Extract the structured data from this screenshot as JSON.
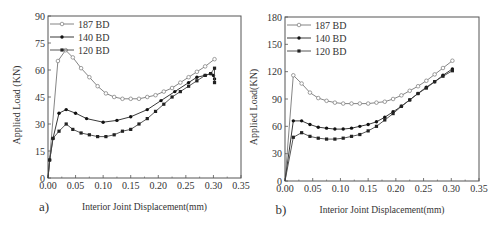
{
  "chart_data": [
    {
      "panel_label": "a)",
      "type": "line",
      "title": "",
      "xlabel": "Interior Joint Displacement(mm)",
      "ylabel": "Applied Load (KN)",
      "xlim": [
        0,
        0.35
      ],
      "ylim": [
        0,
        90
      ],
      "xticks": [
        "0.00",
        "0.05",
        "0.10",
        "0.15",
        "0.20",
        "0.25",
        "0.30",
        "0.35"
      ],
      "yticks": [
        "0",
        "15",
        "30",
        "45",
        "60",
        "75",
        "90"
      ],
      "grid": false,
      "legend_position": "upper left",
      "frame": {
        "left": 48,
        "right": 241,
        "top": 16,
        "bottom": 178
      },
      "series": [
        {
          "name": "187 BD",
          "marker": "open-circle",
          "x": [
            0,
            0.018,
            0.032,
            0.045,
            0.06,
            0.075,
            0.09,
            0.105,
            0.12,
            0.135,
            0.15,
            0.165,
            0.18,
            0.195,
            0.21,
            0.225,
            0.24,
            0.255,
            0.27,
            0.285,
            0.302
          ],
          "y": [
            0,
            65,
            71,
            67,
            61,
            56,
            51,
            47,
            45,
            44,
            44,
            44,
            45,
            46,
            48,
            50,
            53,
            56,
            59,
            62,
            66
          ]
        },
        {
          "name": "140 BD",
          "marker": "filled-circle",
          "x": [
            0,
            0.003,
            0.009,
            0.02,
            0.033,
            0.05,
            0.07,
            0.1,
            0.125,
            0.15,
            0.18,
            0.205,
            0.23,
            0.255,
            0.27,
            0.285,
            0.295,
            0.3,
            0.302
          ],
          "y": [
            0,
            10,
            22,
            36,
            38,
            36,
            33,
            31,
            32,
            34,
            38,
            43,
            48,
            53,
            56,
            57,
            58,
            57,
            55
          ]
        },
        {
          "name": "120 BD",
          "marker": "filled-square",
          "x": [
            0,
            0.003,
            0.009,
            0.02,
            0.033,
            0.045,
            0.06,
            0.075,
            0.09,
            0.105,
            0.12,
            0.135,
            0.15,
            0.165,
            0.18,
            0.195,
            0.21,
            0.225,
            0.24,
            0.255,
            0.27,
            0.285,
            0.295,
            0.302,
            0.302
          ],
          "y": [
            0,
            10,
            22,
            26,
            30,
            27,
            25,
            24,
            23,
            23,
            24,
            26,
            27,
            30,
            33,
            37,
            41,
            45,
            48,
            51,
            54,
            57,
            58,
            61,
            53
          ]
        }
      ]
    },
    {
      "panel_label": "b)",
      "type": "line",
      "title": "",
      "xlabel": "Interior Joint Displacement(mm)",
      "ylabel": "Applied Load(KN)",
      "xlim": [
        0,
        0.35
      ],
      "ylim": [
        0,
        180
      ],
      "xticks": [
        "0.00",
        "0.05",
        "0.10",
        "0.15",
        "0.20",
        "0.25",
        "0.30",
        "0.35"
      ],
      "yticks": [
        "0",
        "30",
        "60",
        "90",
        "120",
        "150",
        "180"
      ],
      "grid": false,
      "legend_position": "upper left",
      "frame": {
        "left": 285,
        "right": 479,
        "top": 17,
        "bottom": 181
      },
      "series": [
        {
          "name": "187 BD",
          "marker": "open-circle",
          "x": [
            0,
            0.015,
            0.03,
            0.045,
            0.06,
            0.075,
            0.09,
            0.105,
            0.12,
            0.135,
            0.15,
            0.165,
            0.18,
            0.195,
            0.21,
            0.225,
            0.24,
            0.255,
            0.27,
            0.285,
            0.302
          ],
          "y": [
            0,
            116,
            107,
            97,
            91,
            88,
            86,
            85,
            85,
            85,
            85,
            86,
            87,
            90,
            94,
            99,
            104,
            110,
            117,
            124,
            132
          ]
        },
        {
          "name": "140 BD",
          "marker": "filled-circle",
          "x": [
            0,
            0.015,
            0.03,
            0.045,
            0.06,
            0.075,
            0.09,
            0.105,
            0.12,
            0.135,
            0.15,
            0.165,
            0.18,
            0.195,
            0.21,
            0.225,
            0.24,
            0.255,
            0.27,
            0.285,
            0.302
          ],
          "y": [
            0,
            66,
            66,
            62,
            59,
            58,
            57,
            57,
            58,
            60,
            62,
            65,
            70,
            76,
            82,
            89,
            96,
            103,
            109,
            116,
            123
          ]
        },
        {
          "name": "120 BD",
          "marker": "filled-square",
          "x": [
            0,
            0.015,
            0.03,
            0.045,
            0.06,
            0.075,
            0.09,
            0.105,
            0.12,
            0.135,
            0.15,
            0.165,
            0.18,
            0.195,
            0.21,
            0.225,
            0.24,
            0.255,
            0.27,
            0.285,
            0.302
          ],
          "y": [
            0,
            48,
            53,
            49,
            47,
            46,
            46,
            47,
            49,
            51,
            55,
            60,
            67,
            74,
            82,
            89,
            96,
            102,
            109,
            115,
            121
          ]
        }
      ]
    }
  ]
}
